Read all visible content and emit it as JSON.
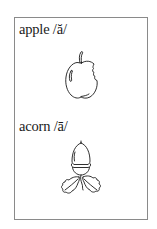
{
  "card": {
    "entries": [
      {
        "word": "apple",
        "phoneme": "/ă/",
        "label": "apple /ă/",
        "picture": "apple-icon"
      },
      {
        "word": "acorn",
        "phoneme": "/ā/",
        "label": "acorn /ā/",
        "picture": "acorn-icon"
      }
    ]
  },
  "colors": {
    "border": "#8a8a8a",
    "ink": "#1a1a1a",
    "background": "#ffffff"
  }
}
